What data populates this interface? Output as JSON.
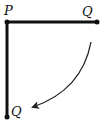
{
  "diagram": {
    "labels": {
      "pivot": "P",
      "end_initial": "Q",
      "end_final": "Q"
    },
    "colors": {
      "rod": "#111111",
      "arrow": "#222222",
      "background": "#ffffff"
    },
    "points": {
      "P": [
        7,
        22
      ],
      "Q_initial": [
        97,
        22
      ],
      "Q_final": [
        7,
        117
      ]
    },
    "arrow": {
      "meaning": "direction-of-rotation",
      "from": [
        91,
        42
      ],
      "to": [
        32,
        107
      ]
    }
  }
}
